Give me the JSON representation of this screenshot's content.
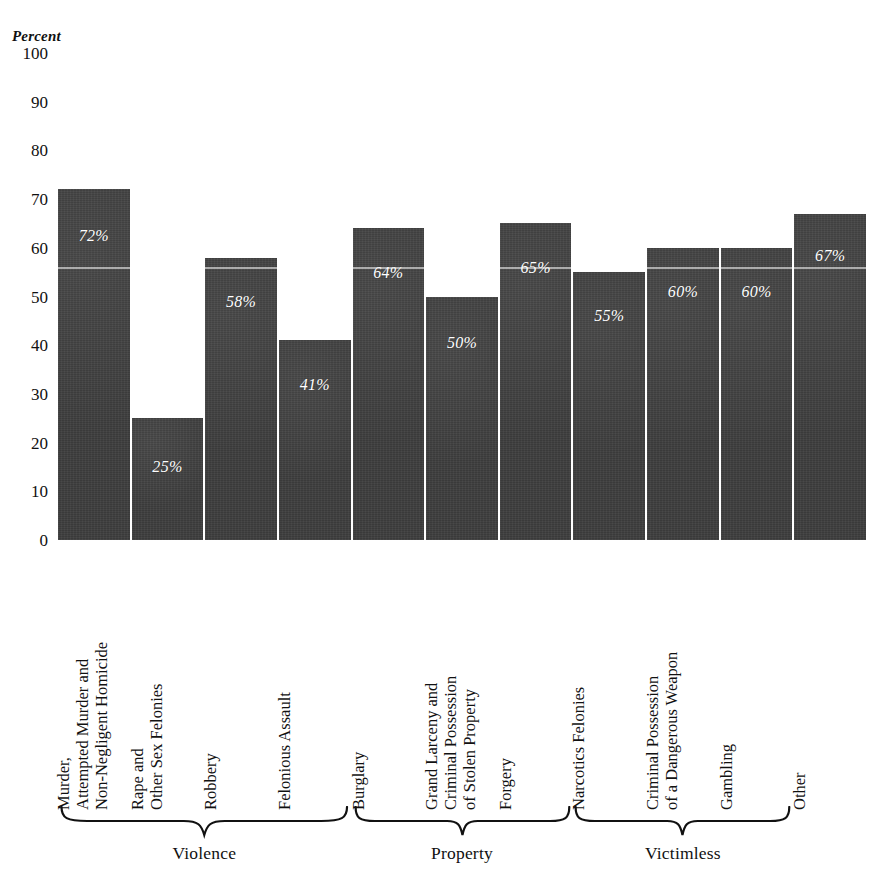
{
  "crop_artifact_text": "partially cropped heading above chart",
  "axis": {
    "y_title": "Percent",
    "yticks": [
      "100",
      "90",
      "80",
      "70",
      "60",
      "50",
      "40",
      "30",
      "20",
      "10",
      "0"
    ]
  },
  "groups": [
    {
      "label": "Violence",
      "start": 0,
      "end": 3
    },
    {
      "label": "Property",
      "start": 4,
      "end": 6
    },
    {
      "label": "Victimless",
      "start": 7,
      "end": 9
    }
  ],
  "chart_data": {
    "type": "bar",
    "title": "",
    "subtitle": "",
    "xlabel": "",
    "ylabel": "Percent",
    "ylim": [
      0,
      100
    ],
    "grid": false,
    "legend": "none",
    "bar_color": "#3a3a3a",
    "value_label_color": "#ffffff",
    "categories": [
      "Murder,\nAttempted Murder and\nNon-Negligent Homicide",
      "Rape and\nOther Sex Felonies",
      "Robbery",
      "Felonious Assault",
      "Burglary",
      "Grand Larceny and\nCriminal Possession\nof Stolen Property",
      "Forgery",
      "Narcotics Felonies",
      "Criminal Possession\nof a Dangerous Weapon",
      "Gambling",
      "Other"
    ],
    "values": [
      72,
      25,
      58,
      41,
      64,
      50,
      65,
      55,
      60,
      60,
      67
    ],
    "value_labels": [
      "72%",
      "25%",
      "58%",
      "41%",
      "64%",
      "50%",
      "65%",
      "55%",
      "60%",
      "60%",
      "67%"
    ],
    "value_label_offsets": [
      38,
      40,
      35,
      36,
      36,
      37,
      36,
      35,
      35,
      35,
      33
    ],
    "group_brackets": [
      "Violence",
      "Property",
      "Victimless"
    ],
    "yticks": [
      0,
      10,
      20,
      30,
      40,
      50,
      60,
      70,
      80,
      90,
      100
    ]
  }
}
